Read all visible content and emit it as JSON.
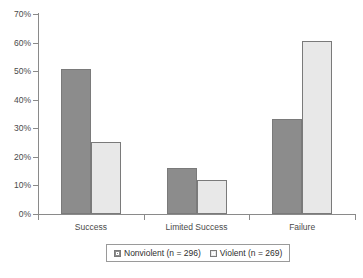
{
  "chart_data": {
    "type": "bar",
    "title": "",
    "subtitle": "",
    "xlabel": "",
    "ylabel": "",
    "categories": [
      "Success",
      "Limited Success",
      "Failure"
    ],
    "series": [
      {
        "name": "Nonviolent (n = 296)",
        "color": "#8c8c8c",
        "values": [
          50.7,
          16.0,
          33.2
        ]
      },
      {
        "name": "Violent (n = 269)",
        "color": "#e8e8e8",
        "values": [
          25.3,
          12.0,
          60.5
        ]
      }
    ],
    "ylim": [
      0,
      70
    ],
    "ytick_values": [
      0,
      10,
      20,
      30,
      40,
      50,
      60,
      70
    ],
    "ytick_labels": [
      "0%",
      "10%",
      "20%",
      "30%",
      "40%",
      "50%",
      "60%",
      "70%"
    ],
    "ytick_step": 10,
    "grid": false,
    "legend_position": "bottom",
    "value_suffix": "%"
  },
  "legend": {
    "items": [
      {
        "label": "Nonviolent (n = 296)",
        "swatch": "series-1-swatch"
      },
      {
        "label": "Violent (n = 269)",
        "swatch": "series-2-swatch"
      }
    ]
  },
  "colors": {
    "series_1": "#8c8c8c",
    "series_2": "#e8e8e8",
    "axis": "#8a8a8a",
    "bar_border": "#7a7a7a",
    "text": "#4a4a4a",
    "background": "#ffffff"
  }
}
